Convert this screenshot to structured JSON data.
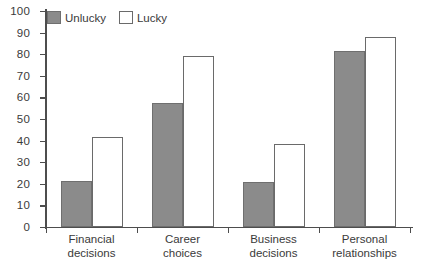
{
  "chart_data": {
    "type": "bar",
    "title": "",
    "xlabel": "",
    "ylabel": "",
    "ylim": [
      0,
      100
    ],
    "ytick_step": 10,
    "yticks": [
      0,
      10,
      20,
      30,
      40,
      50,
      60,
      70,
      80,
      90,
      100
    ],
    "grid": false,
    "legend_position": "top-left",
    "categories": [
      "Financial\ndecisions",
      "Career\nchoices",
      "Business\ndecisions",
      "Personal\nrelationships"
    ],
    "category_lines": [
      [
        "Financial",
        "decisions"
      ],
      [
        "Career",
        "choices"
      ],
      [
        "Business",
        "decisions"
      ],
      [
        "Personal",
        "relationships"
      ]
    ],
    "series": [
      {
        "name": "Unlucky",
        "color": "#8b8b8b",
        "values": [
          21.5,
          57.5,
          21,
          81.5
        ]
      },
      {
        "name": "Lucky",
        "color": "#ffffff",
        "values": [
          41.5,
          79,
          38.5,
          88
        ]
      }
    ]
  },
  "legend": {
    "items": [
      {
        "label": "Unlucky",
        "style": "unlucky"
      },
      {
        "label": "Lucky",
        "style": "lucky"
      }
    ]
  },
  "axis": {
    "y_labels": [
      "100",
      "90",
      "80",
      "70",
      "60",
      "50",
      "40",
      "30",
      "20",
      "10",
      "0"
    ]
  }
}
